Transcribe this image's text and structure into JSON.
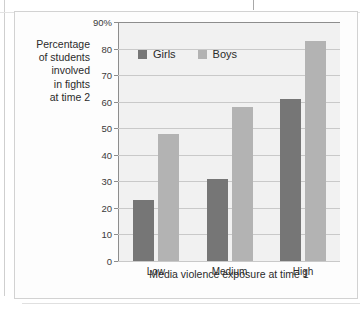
{
  "figure": {
    "y_caption_lines": [
      "Percentage",
      "of students",
      "involved",
      "in fights",
      "at time 2"
    ]
  },
  "chart_data": {
    "type": "bar",
    "title": "",
    "xlabel": "Media violence exposure at time 1",
    "ylabel": "Percentage of students involved in fights at time 2",
    "categories": [
      "Low",
      "Medium",
      "High"
    ],
    "series": [
      {
        "name": "Girls",
        "values": [
          23,
          31,
          61
        ],
        "color": "#767676"
      },
      {
        "name": "Boys",
        "values": [
          48,
          58,
          83
        ],
        "color": "#b3b3b3"
      }
    ],
    "ylim": [
      0,
      90
    ],
    "ytick_labels": [
      "0",
      "10",
      "20",
      "30",
      "40",
      "50",
      "60",
      "70",
      "80",
      "90%"
    ],
    "ytick_values": [
      0,
      10,
      20,
      30,
      40,
      50,
      60,
      70,
      80,
      90
    ],
    "grid": true,
    "legend_position": "top-left-inside",
    "plot_background": "#f1f1f1",
    "axis_color": "#8d8d8d",
    "gridline_color": "#c9c9c9"
  }
}
